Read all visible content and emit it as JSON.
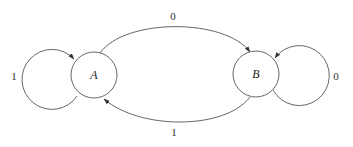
{
  "diagram": {
    "type": "state-machine",
    "states": [
      {
        "id": "A",
        "label": "A",
        "cx": 94,
        "cy": 75,
        "r": 23
      },
      {
        "id": "B",
        "label": "B",
        "cx": 256,
        "cy": 74,
        "r": 23
      }
    ],
    "transitions": [
      {
        "from": "A",
        "to": "A",
        "label": "1"
      },
      {
        "from": "A",
        "to": "B",
        "label": "0"
      },
      {
        "from": "B",
        "to": "B",
        "label": "0"
      },
      {
        "from": "B",
        "to": "A",
        "label": "1"
      }
    ],
    "colors": {
      "stroke": "#555555",
      "text": "#222222",
      "background": "#ffffff"
    }
  }
}
